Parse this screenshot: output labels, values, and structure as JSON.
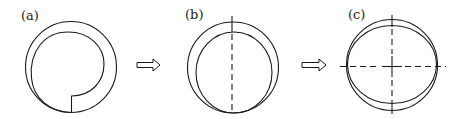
{
  "diagram": {
    "panels": [
      {
        "id": "a",
        "label": "(a)"
      },
      {
        "id": "b",
        "label": "(b)"
      },
      {
        "id": "c",
        "label": "(c)"
      }
    ],
    "arrows": [
      {
        "from": "a",
        "to": "b",
        "icon": "hollow-right-arrow-icon"
      },
      {
        "from": "b",
        "to": "c",
        "icon": "hollow-right-arrow-icon"
      }
    ],
    "colors": {
      "line": "#1a1a1a",
      "background": "#ffffff"
    }
  }
}
